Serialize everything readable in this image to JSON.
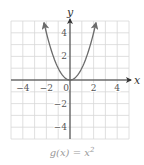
{
  "chart_data": {
    "type": "line",
    "caption": "g(x) = x²",
    "function": "x^2",
    "xlabel": "x",
    "ylabel": "y",
    "xlim": [
      -5,
      5
    ],
    "ylim": [
      -5,
      5
    ],
    "grid": true,
    "x_ticks": [
      -4,
      -2,
      0,
      2,
      4
    ],
    "y_ticks": [
      -4,
      -2,
      2,
      4
    ],
    "x_tick_labels": [
      "−4",
      "−2",
      "0",
      "2",
      "4"
    ],
    "y_tick_labels": [
      "−4",
      "−2",
      "2",
      "4"
    ],
    "series": [
      {
        "name": "g(x) = x^2",
        "x": [
          -2.2,
          -2,
          -1.5,
          -1,
          -0.5,
          0,
          0.5,
          1,
          1.5,
          2,
          2.2
        ],
        "y": [
          4.84,
          4,
          2.25,
          1,
          0.25,
          0,
          0.25,
          1,
          2.25,
          4,
          4.84
        ],
        "arrows_at_ends": true
      }
    ],
    "colors": {
      "grid": "#d8d8d8",
      "axes": "#333333",
      "curve": "#6b6b6b",
      "tick_labels": "#555555",
      "caption": "#9a9a9a"
    }
  }
}
